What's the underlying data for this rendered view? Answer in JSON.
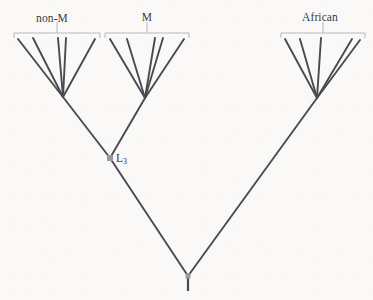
{
  "figure": {
    "type": "phylogenetic-tree",
    "background_color": "#faf9f7",
    "branch_color": "#4a4a52",
    "bracket_color": "#b9b9bd",
    "node_marker_color": "#9a9a9e",
    "text_color": "#3b3b41"
  },
  "clades": [
    {
      "id": "non-m",
      "label": "non-M",
      "label_x": 52,
      "label_y": 12,
      "bracket": {
        "x1": 14,
        "x2": 100,
        "y": 33,
        "tick_height": 5,
        "stem_top": 22
      },
      "apex": {
        "x": 63,
        "y": 97
      },
      "tips": [
        {
          "x": 18,
          "y": 39
        },
        {
          "x": 33,
          "y": 38
        },
        {
          "x": 58,
          "y": 38
        },
        {
          "x": 66,
          "y": 38
        },
        {
          "x": 95,
          "y": 39
        }
      ]
    },
    {
      "id": "m",
      "label": "M",
      "label_x": 147,
      "label_y": 11,
      "bracket": {
        "x1": 105,
        "x2": 189,
        "y": 33,
        "tick_height": 5,
        "stem_top": 22
      },
      "apex": {
        "x": 145,
        "y": 98
      },
      "tips": [
        {
          "x": 110,
          "y": 39
        },
        {
          "x": 127,
          "y": 39
        },
        {
          "x": 155,
          "y": 38
        },
        {
          "x": 163,
          "y": 38
        },
        {
          "x": 184,
          "y": 39
        }
      ]
    },
    {
      "id": "african",
      "label": "African",
      "label_x": 320,
      "label_y": 11,
      "bracket": {
        "x1": 281,
        "x2": 365,
        "y": 33,
        "tick_height": 5,
        "stem_top": 22
      },
      "apex": {
        "x": 317,
        "y": 98
      },
      "tips": [
        {
          "x": 285,
          "y": 39
        },
        {
          "x": 300,
          "y": 39
        },
        {
          "x": 321,
          "y": 38
        },
        {
          "x": 352,
          "y": 39
        },
        {
          "x": 360,
          "y": 40
        }
      ]
    }
  ],
  "internal_nodes": [
    {
      "id": "l3",
      "label": "L",
      "label_sub": "3",
      "label_x": 116,
      "label_y": 152,
      "marker": {
        "x": 110,
        "y": 158,
        "size": 6,
        "shape": "square"
      }
    },
    {
      "id": "root",
      "label": "",
      "marker": {
        "x": 188,
        "y": 276,
        "size": 5,
        "shape": "square"
      },
      "stem": {
        "x": 188,
        "y1": 278,
        "y2": 291
      }
    }
  ],
  "edges": [
    {
      "from": "l3",
      "to": "non-m-apex",
      "x1": 110,
      "y1": 158,
      "x2": 63,
      "y2": 97
    },
    {
      "from": "l3",
      "to": "m-apex",
      "x1": 110,
      "y1": 158,
      "x2": 145,
      "y2": 98
    },
    {
      "from": "root",
      "to": "l3",
      "x1": 188,
      "y1": 276,
      "x2": 110,
      "y2": 158
    },
    {
      "from": "root",
      "to": "african-apex",
      "x1": 188,
      "y1": 276,
      "x2": 317,
      "y2": 98
    }
  ]
}
